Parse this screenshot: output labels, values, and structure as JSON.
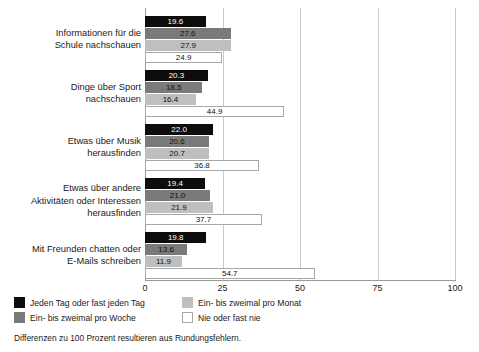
{
  "chart_data": {
    "type": "bar",
    "orientation": "horizontal",
    "title": "",
    "xlabel": "",
    "ylabel": "",
    "xlim": [
      0,
      100
    ],
    "xticks": [
      "0",
      "25",
      "50",
      "75",
      "100"
    ],
    "grid": true,
    "legend_position": "bottom-left",
    "categories": [
      "Informationen für die Schule nachschauen",
      "Dinge über Sport nachschauen",
      "Etwas über Musik herausfinden",
      "Etwas über andere Aktivitäten oder Interessen herausfinden",
      "Mit Freunden chatten oder E-Mails schreiben"
    ],
    "category_lines": [
      [
        "Informationen für die",
        "Schule nachschauen"
      ],
      [
        "Dinge über Sport",
        "nachschauen"
      ],
      [
        "Etwas über Musik",
        "herausfinden"
      ],
      [
        "Etwas über andere",
        "Aktivitäten oder Interessen",
        "herausfinden"
      ],
      [
        "Mit Freunden chatten oder",
        "E-Mails schreiben"
      ]
    ],
    "series": [
      {
        "name": "Jeden Tag oder fast jeden Tag",
        "color": "#0d0d0d",
        "values": [
          19.6,
          20.3,
          22.0,
          19.4,
          19.8
        ]
      },
      {
        "name": "Ein- bis zweimal pro Woche",
        "color": "#7a7a7a",
        "values": [
          27.6,
          18.5,
          20.6,
          21.0,
          13.6
        ]
      },
      {
        "name": "Ein- bis zweimal pro Monat",
        "color": "#bfbfbf",
        "values": [
          27.9,
          16.4,
          20.7,
          21.9,
          11.9
        ]
      },
      {
        "name": "Nie oder fast nie",
        "color": "#ffffff",
        "values": [
          24.9,
          44.9,
          36.8,
          37.7,
          54.7
        ]
      }
    ],
    "footnote": "Differenzen zu 100 Prozent resultieren aus Rundungsfehlern."
  },
  "legend": {
    "items": [
      {
        "label": "Jeden Tag oder fast jeden Tag",
        "swatch": "s0"
      },
      {
        "label": "Ein- bis zweimal pro Monat",
        "swatch": "s2"
      },
      {
        "label": "Ein- bis zweimal pro Woche",
        "swatch": "s1"
      },
      {
        "label": "Nie oder fast nie",
        "swatch": "s3"
      }
    ]
  }
}
